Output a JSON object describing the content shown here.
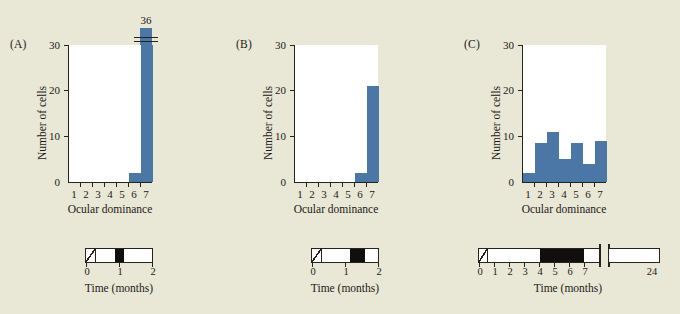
{
  "figure": {
    "background_color": "#e9e7d6",
    "bar_color": "#4a77a6",
    "axis_color": "#26231d"
  },
  "chart_data": [
    {
      "type": "bar",
      "panel": "(A)",
      "title": "",
      "xlabel": "Ocular dominance",
      "ylabel": "Number of cells",
      "categories": [
        "1",
        "2",
        "3",
        "4",
        "5",
        "6",
        "7"
      ],
      "values": [
        0,
        0,
        0,
        0,
        0,
        2,
        36
      ],
      "ylim": [
        0,
        30
      ],
      "yticks": [
        "0",
        "10",
        "20",
        "30"
      ],
      "grid": false,
      "legend": "none",
      "broken_axis": true,
      "overflow_label": "36",
      "overflow_category": "7",
      "timeline": {
        "xlabel": "Time (months)",
        "ticks": [
          "0",
          "1",
          "2"
        ],
        "axis_max": 2,
        "broken": false,
        "segments": [
          {
            "kind": "hatch",
            "start": 0.0,
            "end": 0.25
          },
          {
            "kind": "white",
            "start": 0.25,
            "end": 0.85
          },
          {
            "kind": "black",
            "start": 0.85,
            "end": 1.12
          },
          {
            "kind": "white",
            "start": 1.12,
            "end": 2.0
          }
        ]
      }
    },
    {
      "type": "bar",
      "panel": "(B)",
      "title": "",
      "xlabel": "Ocular dominance",
      "ylabel": "Number of cells",
      "categories": [
        "1",
        "2",
        "3",
        "4",
        "5",
        "6",
        "7"
      ],
      "values": [
        0,
        0,
        0,
        0,
        0,
        2,
        21
      ],
      "ylim": [
        0,
        30
      ],
      "yticks": [
        "0",
        "10",
        "20",
        "30"
      ],
      "grid": false,
      "legend": "none",
      "broken_axis": false,
      "timeline": {
        "xlabel": "Time (months)",
        "ticks": [
          "0",
          "1",
          "2"
        ],
        "axis_max": 2,
        "broken": false,
        "segments": [
          {
            "kind": "hatch",
            "start": 0.0,
            "end": 0.25
          },
          {
            "kind": "white",
            "start": 0.25,
            "end": 1.12
          },
          {
            "kind": "black",
            "start": 1.12,
            "end": 1.55
          },
          {
            "kind": "white",
            "start": 1.55,
            "end": 2.0
          }
        ]
      }
    },
    {
      "type": "bar",
      "panel": "(C)",
      "title": "",
      "xlabel": "Ocular dominance",
      "ylabel": "Number of cells",
      "categories": [
        "1",
        "2",
        "3",
        "4",
        "5",
        "6",
        "7"
      ],
      "values": [
        2,
        8.5,
        11,
        5,
        8.5,
        4,
        9
      ],
      "ylim": [
        0,
        30
      ],
      "yticks": [
        "0",
        "10",
        "20",
        "30"
      ],
      "grid": false,
      "legend": "none",
      "broken_axis": false,
      "timeline": {
        "xlabel": "Time (months)",
        "ticks": [
          "0",
          "1",
          "2",
          "3",
          "4",
          "5",
          "6",
          "7",
          "24"
        ],
        "axis_max": 8,
        "broken": true,
        "break_at": 7.6,
        "segments": [
          {
            "kind": "hatch",
            "start": 0.0,
            "end": 0.3
          },
          {
            "kind": "white",
            "start": 0.3,
            "end": 4.0
          },
          {
            "kind": "black",
            "start": 4.0,
            "end": 7.0
          },
          {
            "kind": "white",
            "start": 7.0,
            "end": 7.6
          }
        ],
        "post_break_segment": {
          "kind": "white",
          "label": "24"
        }
      }
    }
  ]
}
